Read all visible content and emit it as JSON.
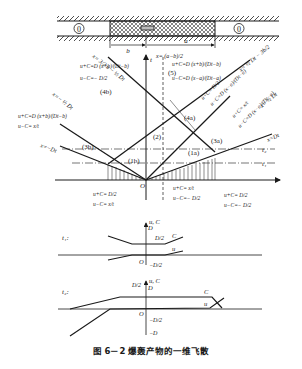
{
  "caption": "图 6－2  爆轰产物的一维飞散",
  "tube": {
    "left_region": "0",
    "right_region": "0",
    "dim_b": "b",
    "dim_a": "a",
    "detonation_marker": "⇦"
  },
  "axes": {
    "t": "t",
    "O": "O",
    "t1": "t₁",
    "t2": "t₂",
    "top_x": "x= (a−b)/2"
  },
  "regions": {
    "r1a": "(1a)",
    "r1b": "(1b)",
    "r2": "(2)",
    "r3a": "(3a)",
    "r3b": "(3b)",
    "r4a": "(4a)",
    "r4b": "(4b)",
    "r5": "(5)"
  },
  "lines": {
    "x_eq_Dt": "x=Dt",
    "x_eq_half_Dt": "x= ½ Dt",
    "x_eq_half_Dt_minus_3b2": "x= ½ Dt − 3b/2",
    "x_eq_neg_Dt": "x=−Dt",
    "x_eq_neg_half_Dt": "x=− ½ Dt",
    "x_eq_3a2_minus_half_Dt": "x= 3/2 a − ½ Dt"
  },
  "formulas": {
    "f5_top": "u+C=D (x+b)/(Dt−b)",
    "f5_bot": "u−C=D (x−a)/(Dt−a)",
    "f4a_top": "u+C= D/2",
    "f4a_bot": "u−C=D (x−a)/(Dt−a)",
    "f3a_top": "u+C= x/t",
    "f3a_bot": "u−C=D (x−a)/(Dt−a)",
    "f4b_top": "u+C=D (x+b)/(Dt−b)",
    "f4b_bot": "u−C=− D/2",
    "f3b_top": "u+C=D (x+b)/(Dt−b)",
    "f3b_bot": "u−C= x/t",
    "f1b_top": "u+C= D/2",
    "f1b_bot": "u−C= x/t",
    "f1a_top": "u+C= x/t",
    "f1a_bot": "u−C=− D/2",
    "f2_top": "u+C= D/2",
    "f2_bot": "u−C=− D/2"
  },
  "profile_t1": {
    "label": "t₁:",
    "axis": "u, C",
    "D": "D",
    "D_half": "D/2",
    "C": "C",
    "u": "u",
    "O": "O",
    "neg_D_half": "−D/2"
  },
  "profile_t2": {
    "label": "t₂:",
    "axis": "u, C",
    "D": "D",
    "D_half": "D/2",
    "C": "C",
    "u": "u",
    "O": "O",
    "neg_D_half": "−D/2",
    "neg_D": "−D"
  }
}
